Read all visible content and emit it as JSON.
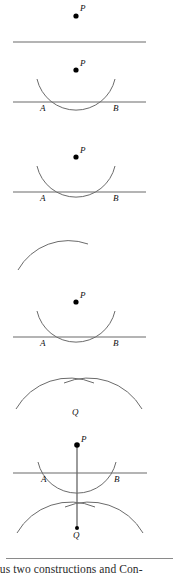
{
  "document": {
    "kind": "geometry-construction-figure",
    "caption_line": "ous two constructions and Con-"
  },
  "labels": {
    "point_p": "P",
    "point_a": "A",
    "point_b": "B",
    "point_q": "Q"
  },
  "panels": [
    {
      "id": "panel-1",
      "step": "1",
      "description": "Point P above a straight line",
      "labels": [
        "P"
      ]
    },
    {
      "id": "panel-2",
      "step": "2",
      "description": "Arc centered at P crosses the line at A and B",
      "labels": [
        "P",
        "A",
        "B"
      ]
    },
    {
      "id": "panel-3",
      "step": "3",
      "description": "Arc centered at P crossing the line at A and B",
      "labels": [
        "P",
        "A",
        "B"
      ]
    },
    {
      "id": "panel-4",
      "step": "4",
      "description": "Single arc swung from A",
      "labels": []
    },
    {
      "id": "panel-5",
      "step": "5",
      "description": "Arc centered at P crossing the line at A and B",
      "labels": [
        "P",
        "A",
        "B"
      ]
    },
    {
      "id": "panel-6",
      "step": "6",
      "description": "Two arcs from A and B crossing at Q",
      "labels": [
        "Q"
      ]
    },
    {
      "id": "panel-7",
      "step": "7",
      "description": "Line through P and Q perpendicular to line AB",
      "labels": [
        "P",
        "A",
        "B",
        "Q"
      ]
    }
  ],
  "style": {
    "stroke": "#5d5d5d",
    "dot": "#000000",
    "rule": "#8a8a8a"
  }
}
